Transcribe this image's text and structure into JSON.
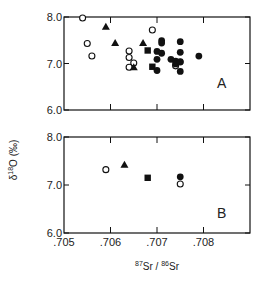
{
  "chart_data": [
    {
      "type": "scatter",
      "panel": "A",
      "xlabel": "87Sr/86Sr",
      "ylabel": "δ18O (‰)",
      "xlim": [
        0.705,
        0.709
      ],
      "ylim": [
        6.0,
        8.0
      ],
      "x_ticks": [
        ".705",
        ".706",
        ".707",
        ".708"
      ],
      "y_ticks": [
        "6.0",
        "7.0",
        "8.0"
      ],
      "grid": false,
      "series": [
        {
          "name": "open-circle",
          "marker": "open-circle",
          "points": [
            [
              0.7054,
              7.98
            ],
            [
              0.7055,
              7.43
            ],
            [
              0.7056,
              7.16
            ],
            [
              0.7069,
              7.72
            ],
            [
              0.7064,
              7.27
            ],
            [
              0.7064,
              7.13
            ],
            [
              0.7065,
              7.01
            ],
            [
              0.7064,
              6.92
            ],
            [
              0.7074,
              6.95
            ]
          ]
        },
        {
          "name": "filled-triangle",
          "marker": "filled-triangle",
          "points": [
            [
              0.7059,
              7.79
            ],
            [
              0.7061,
              7.44
            ],
            [
              0.7067,
              7.44
            ],
            [
              0.7065,
              6.92
            ]
          ]
        },
        {
          "name": "filled-square",
          "marker": "filled-square",
          "points": [
            [
              0.7068,
              7.28
            ],
            [
              0.7069,
              6.93
            ]
          ]
        },
        {
          "name": "filled-circle",
          "marker": "filled-circle",
          "points": [
            [
              0.7071,
              7.49
            ],
            [
              0.7071,
              7.44
            ],
            [
              0.707,
              7.26
            ],
            [
              0.7071,
              7.22
            ],
            [
              0.707,
              7.09
            ],
            [
              0.707,
              6.85
            ],
            [
              0.7073,
              7.09
            ],
            [
              0.7074,
              7.05
            ],
            [
              0.7075,
              7.03
            ],
            [
              0.7074,
              6.99
            ],
            [
              0.7075,
              7.04
            ],
            [
              0.7075,
              6.83
            ],
            [
              0.7075,
              7.47
            ],
            [
              0.7075,
              7.24
            ],
            [
              0.7079,
              7.16
            ]
          ]
        }
      ]
    },
    {
      "type": "scatter",
      "panel": "B",
      "xlabel": "87Sr/86Sr",
      "ylabel": "δ18O (‰)",
      "xlim": [
        0.705,
        0.709
      ],
      "ylim": [
        6.0,
        8.0
      ],
      "x_ticks": [
        ".705",
        ".706",
        ".707",
        ".708"
      ],
      "y_ticks": [
        "6.0",
        "7.0",
        "8.0"
      ],
      "grid": false,
      "series": [
        {
          "name": "open-circle",
          "marker": "open-circle",
          "points": [
            [
              0.7059,
              7.32
            ],
            [
              0.7075,
              7.02
            ]
          ]
        },
        {
          "name": "filled-triangle",
          "marker": "filled-triangle",
          "points": [
            [
              0.7063,
              7.42
            ]
          ]
        },
        {
          "name": "filled-square",
          "marker": "filled-square",
          "points": [
            [
              0.7068,
              7.15
            ]
          ]
        },
        {
          "name": "filled-circle",
          "marker": "filled-circle",
          "points": [
            [
              0.7075,
              7.17
            ]
          ]
        }
      ]
    }
  ],
  "labels": {
    "panel_a": "A",
    "panel_b": "B",
    "y_axis_prefix": "δ",
    "y_axis_sup": "18",
    "y_axis_main": "O (‰)",
    "x_axis_sup1": "87",
    "x_axis_mid": "Sr / ",
    "x_axis_sup2": "86",
    "x_axis_end": "Sr"
  },
  "colors": {
    "ink": "#111111",
    "background": "#ffffff"
  }
}
